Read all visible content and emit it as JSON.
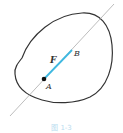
{
  "figure": {
    "labels": {
      "force": "F",
      "point_a": "A",
      "point_b": "B"
    },
    "caption": "图 1-3",
    "colors": {
      "outline": "#333333",
      "line_of_action": "#999999",
      "force_vector": "#3fb8e0",
      "point": "#111111"
    }
  }
}
